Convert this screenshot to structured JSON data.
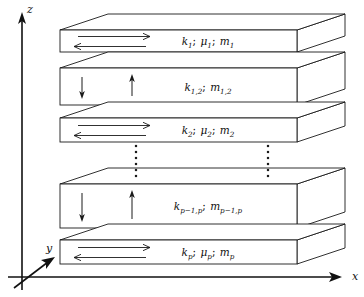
{
  "figure": {
    "background_color": "#ffffff",
    "line_color": "#1a1a1a"
  },
  "axes": {
    "z": {
      "label": "z",
      "x": 27,
      "y": 4,
      "direction": "up"
    },
    "y": {
      "label": "y",
      "x": 46,
      "y": 243,
      "direction": "up-right-diagonal"
    },
    "x": {
      "label": "x",
      "x": 352,
      "y": 271,
      "direction": "right"
    },
    "origin": {
      "x": 22,
      "y": 277
    }
  },
  "layers": [
    {
      "id": "layer-1",
      "kind": "medium",
      "thickness": "thin",
      "label_parts": {
        "k": "k",
        "k_sub": "1",
        "mu": "μ",
        "mu_sub": "1",
        "m": "m",
        "m_sub": "1"
      },
      "label_text": "k₁; μ₁; m₁",
      "arrows": [
        "right",
        "left"
      ],
      "front_top_y": 30,
      "front_bottom_y": 52
    },
    {
      "id": "layer-1-2",
      "kind": "interface",
      "thickness": "thick",
      "label_parts": {
        "k": "k",
        "k_sub": "1,2",
        "mu": null,
        "mu_sub": null,
        "m": "m",
        "m_sub": "1,2"
      },
      "label_text": "k₁,₂; m₁,₂",
      "arrows": [
        "down",
        "up"
      ],
      "front_top_y": 68,
      "front_bottom_y": 105
    },
    {
      "id": "layer-2",
      "kind": "medium",
      "thickness": "thin",
      "label_parts": {
        "k": "k",
        "k_sub": "2",
        "mu": "μ",
        "mu_sub": "2",
        "m": "m",
        "m_sub": "2"
      },
      "label_text": "k₂; μ₂; m₂",
      "arrows": [
        "right",
        "left"
      ],
      "front_top_y": 118,
      "front_bottom_y": 142
    },
    {
      "id": "layer-p-1-p",
      "kind": "interface",
      "thickness": "thick",
      "label_parts": {
        "k": "k",
        "k_sub": "p−1,p",
        "mu": null,
        "mu_sub": null,
        "m": "m",
        "m_sub": "p−1,p"
      },
      "label_text": "k_{p−1,p}; m_{p−1,p}",
      "arrows": [
        "down",
        "up"
      ],
      "front_top_y": 184,
      "front_bottom_y": 228
    },
    {
      "id": "layer-p",
      "kind": "medium",
      "thickness": "thin",
      "label_parts": {
        "k": "k",
        "k_sub": "p",
        "mu": "μ",
        "mu_sub": "p",
        "m": "m",
        "m_sub": "p"
      },
      "label_text": "k_p; μ_p; m_p",
      "arrows": [
        "right",
        "left"
      ],
      "front_top_y": 240,
      "front_bottom_y": 264
    }
  ],
  "ellipsis": {
    "symbol": "vertical-dots",
    "count": 6,
    "columns": [
      {
        "x": 136,
        "y_start": 146,
        "y_end": 176
      },
      {
        "x": 268,
        "y_start": 146,
        "y_end": 176
      }
    ]
  },
  "geometry": {
    "front_left_x": 60,
    "front_right_x": 297,
    "depth_dx": 48,
    "depth_dy": -16
  }
}
